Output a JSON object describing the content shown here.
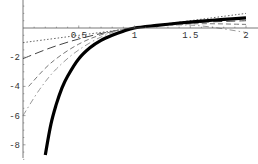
{
  "chart_data": {
    "type": "line",
    "title": "",
    "xlabel": "",
    "ylabel": "",
    "xlim": [
      0,
      2.05
    ],
    "ylim": [
      -9,
      1.9
    ],
    "grid": false,
    "legend": null,
    "x_ticks": [
      {
        "value": 0.5,
        "label": "0.5"
      },
      {
        "value": 1,
        "label": "1"
      },
      {
        "value": 1.5,
        "label": "1.5"
      },
      {
        "value": 2,
        "label": "2"
      }
    ],
    "y_ticks": [
      {
        "value": -2,
        "label": "-2"
      },
      {
        "value": -4,
        "label": "-4"
      },
      {
        "value": -6,
        "label": "-6"
      },
      {
        "value": -8,
        "label": "-8"
      }
    ],
    "series": [
      {
        "name": "ln(x)",
        "style": "thick-solid",
        "color": "#000000",
        "x": [
          0.2,
          0.25,
          0.3,
          0.35,
          0.4,
          0.5,
          0.6,
          0.7,
          0.8,
          0.9,
          1.0,
          1.2,
          1.4,
          1.6,
          1.8,
          2.0
        ],
        "y": [
          -8.7,
          -6.6,
          -5.2,
          -4.1,
          -3.3,
          -2.1,
          -1.35,
          -0.85,
          -0.5,
          -0.22,
          0,
          0.18,
          0.34,
          0.47,
          0.59,
          0.69
        ]
      },
      {
        "name": "approx-1",
        "style": "dotted",
        "color": "#555555",
        "x": [
          0.0,
          1.0,
          2.0
        ],
        "y": [
          -1.0,
          0.0,
          1.0
        ]
      },
      {
        "name": "approx-2",
        "style": "long-dash",
        "color": "#444444",
        "x": [
          0.0,
          0.25,
          0.5,
          0.75,
          1.0,
          1.5,
          2.0
        ],
        "y": [
          -2.1,
          -1.35,
          -0.75,
          -0.3,
          0,
          0.35,
          0.5
        ]
      },
      {
        "name": "approx-3",
        "style": "dash",
        "color": "#777777",
        "x": [
          0.05,
          0.25,
          0.5,
          0.75,
          1.0,
          1.5,
          2.0
        ],
        "y": [
          -4.0,
          -2.4,
          -1.1,
          -0.35,
          0,
          0.28,
          0.25
        ]
      },
      {
        "name": "approx-4",
        "style": "dash-dot",
        "color": "#999999",
        "x": [
          0.0,
          0.15,
          0.3,
          0.5,
          0.75,
          1.0,
          1.5,
          2.0
        ],
        "y": [
          -6.0,
          -4.2,
          -2.8,
          -1.5,
          -0.45,
          0,
          0.2,
          -0.3
        ]
      }
    ]
  }
}
